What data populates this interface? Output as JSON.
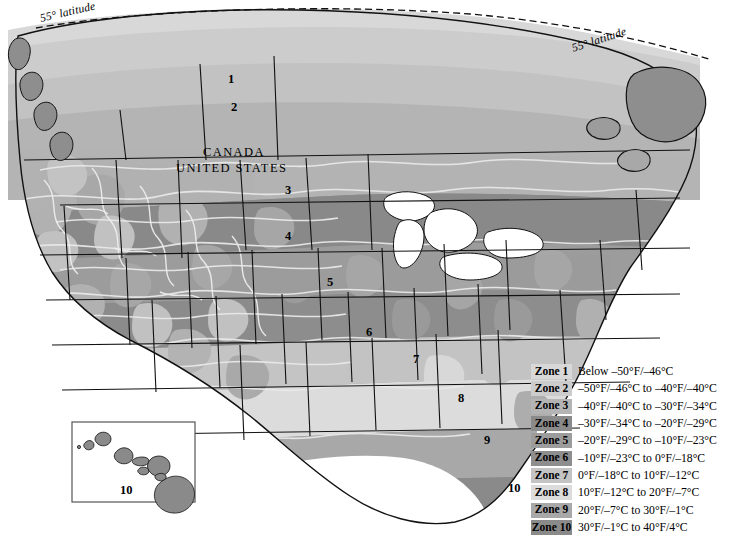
{
  "map": {
    "title_labels": {
      "latitude_left": "55° latitude",
      "latitude_right": "55° latitude",
      "canada": "CANADA",
      "united_states": "UNITED STATES"
    },
    "zone_markers": [
      {
        "zone": "1",
        "x": 228,
        "y": 72
      },
      {
        "zone": "2",
        "x": 231,
        "y": 100
      },
      {
        "zone": "3",
        "x": 285,
        "y": 183
      },
      {
        "zone": "4",
        "x": 285,
        "y": 229
      },
      {
        "zone": "5",
        "x": 327,
        "y": 275
      },
      {
        "zone": "6",
        "x": 366,
        "y": 325
      },
      {
        "zone": "7",
        "x": 413,
        "y": 352
      },
      {
        "zone": "8",
        "x": 458,
        "y": 391
      },
      {
        "zone": "9",
        "x": 484,
        "y": 433
      },
      {
        "zone": "10",
        "x": 508,
        "y": 481
      },
      {
        "zone": "10",
        "x": 120,
        "y": 483
      }
    ]
  },
  "legend": {
    "rows": [
      {
        "name": "Zone 1",
        "range": "Below –50°F/–46°C",
        "color": "#d8d8d8"
      },
      {
        "name": "Zone 2",
        "range": "–50°F/–46°C to –40°F/–40°C",
        "color": "#cccccc"
      },
      {
        "name": "Zone 3",
        "range": "–40°F/–40°C to –30°F/–34°C",
        "color": "#b4b4b4"
      },
      {
        "name": "Zone 4",
        "range": "–30°F/–34°C to –20°F/–29°C",
        "color": "#8a8a8a"
      },
      {
        "name": "Zone 5",
        "range": "–20°F/–29°C to –10°F/–23°C",
        "color": "#9c9c9c"
      },
      {
        "name": "Zone 6",
        "range": "–10°F/–23°C to 0°F/–18°C",
        "color": "#8e8e8e"
      },
      {
        "name": "Zone 7",
        "range": "0°F/–18°C to 10°F/–12°C",
        "color": "#c4c4c4"
      },
      {
        "name": "Zone 8",
        "range": "10°F/–12°C to 20°F/–7°C",
        "color": "#dcdcdc"
      },
      {
        "name": "Zone 9",
        "range": "20°F/–7°C to 30°F/–1°C",
        "color": "#a8a8a8"
      },
      {
        "name": "Zone 10",
        "range": "30°F/–1°C to 40°F/4°C",
        "color": "#8a8a8a"
      }
    ]
  }
}
